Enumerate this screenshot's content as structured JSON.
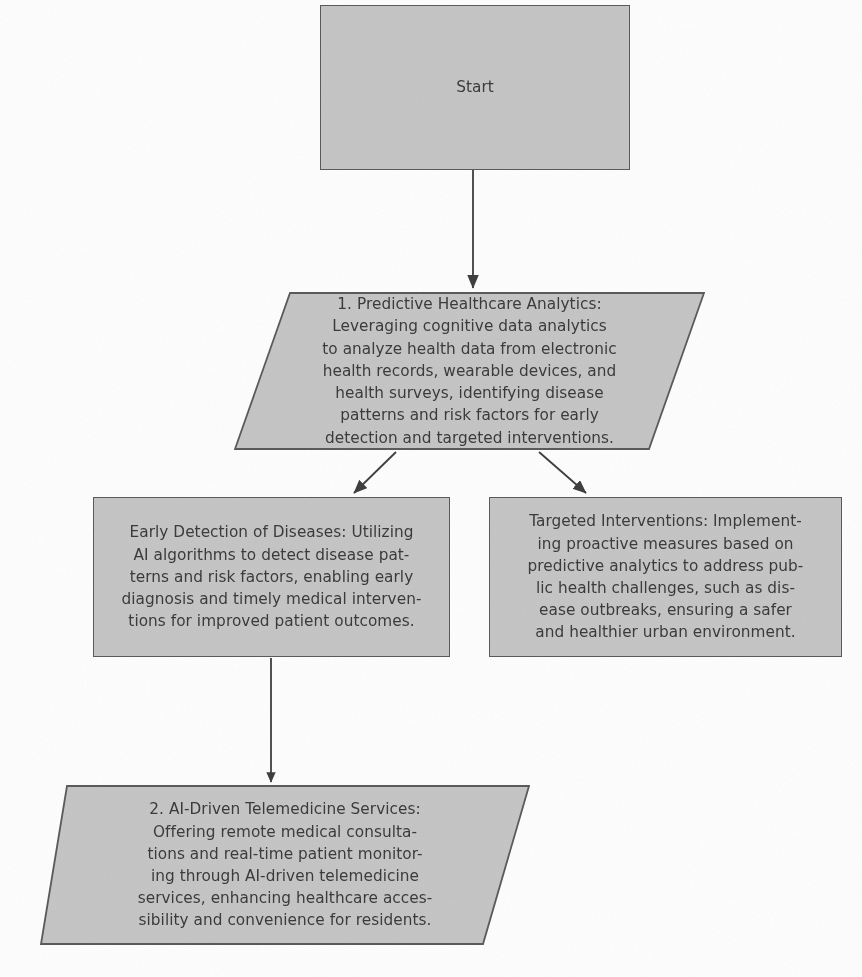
{
  "diagram": {
    "background_color": "#fefefe",
    "node_fill_color": "#c6c6c6",
    "node_border_color": "#5b5b5b",
    "text_color": "#3b3b3b",
    "connector_color": "#3f3f3f",
    "nodes": [
      {
        "id": "start",
        "shape": "rectangle",
        "text": "Start",
        "x": 320,
        "y": 5,
        "width": 310,
        "height": 165
      },
      {
        "id": "predictive-healthcare-analytics",
        "shape": "parallelogram",
        "text": "1. Predictive Healthcare Analytics:\nLeveraging cognitive data analytics\nto analyze health data from electronic\nhealth records, wearable devices, and\nhealth surveys, identifying disease\npatterns and risk factors for early\ndetection and targeted interventions.",
        "x": 234,
        "y": 292,
        "width": 471,
        "height": 158,
        "skew": 56
      },
      {
        "id": "early-detection-of-diseases",
        "shape": "rectangle",
        "text": "Early Detection of Diseases: Utilizing\nAI algorithms to detect disease pat-\nterns and risk factors, enabling early\ndiagnosis and timely medical interven-\ntions for improved patient outcomes.",
        "x": 93,
        "y": 497,
        "width": 357,
        "height": 160
      },
      {
        "id": "targeted-interventions",
        "shape": "rectangle",
        "text": "Targeted Interventions: Implement-\ning proactive measures based on\npredictive analytics to address pub-\nlic health challenges, such as dis-\nease outbreaks, ensuring a safer\nand healthier urban environment.",
        "x": 489,
        "y": 497,
        "width": 353,
        "height": 160
      },
      {
        "id": "ai-driven-telemedicine-services",
        "shape": "parallelogram",
        "text": "2. AI-Driven Telemedicine Services:\nOffering remote medical consulta-\ntions and real-time patient monitor-\ning through AI-driven telemedicine\nservices, enhancing healthcare acces-\nsibility and convenience for residents.",
        "x": 40,
        "y": 785,
        "width": 490,
        "height": 160,
        "skew": 47
      }
    ],
    "connectors": [
      {
        "id": "start-to-predictive",
        "from": "start",
        "to": "predictive-healthcare-analytics",
        "type": "straight-vertical-arrow",
        "x1": 473,
        "y1": 170,
        "x2": 473,
        "y2": 290
      },
      {
        "id": "predictive-to-early-detection",
        "from": "predictive-healthcare-analytics",
        "to": "early-detection-of-diseases",
        "type": "diagonal-arrow",
        "x1": 396,
        "y1": 452,
        "x2": 353,
        "y2": 495
      },
      {
        "id": "predictive-to-targeted-interventions",
        "from": "predictive-healthcare-analytics",
        "to": "targeted-interventions",
        "type": "diagonal-arrow",
        "x1": 539,
        "y1": 452,
        "x2": 587,
        "y2": 495
      },
      {
        "id": "early-detection-to-telemedicine",
        "from": "early-detection-of-diseases",
        "to": "ai-driven-telemedicine-services",
        "type": "straight-vertical-arrow",
        "x1": 271,
        "y1": 658,
        "x2": 271,
        "y2": 784
      }
    ]
  }
}
